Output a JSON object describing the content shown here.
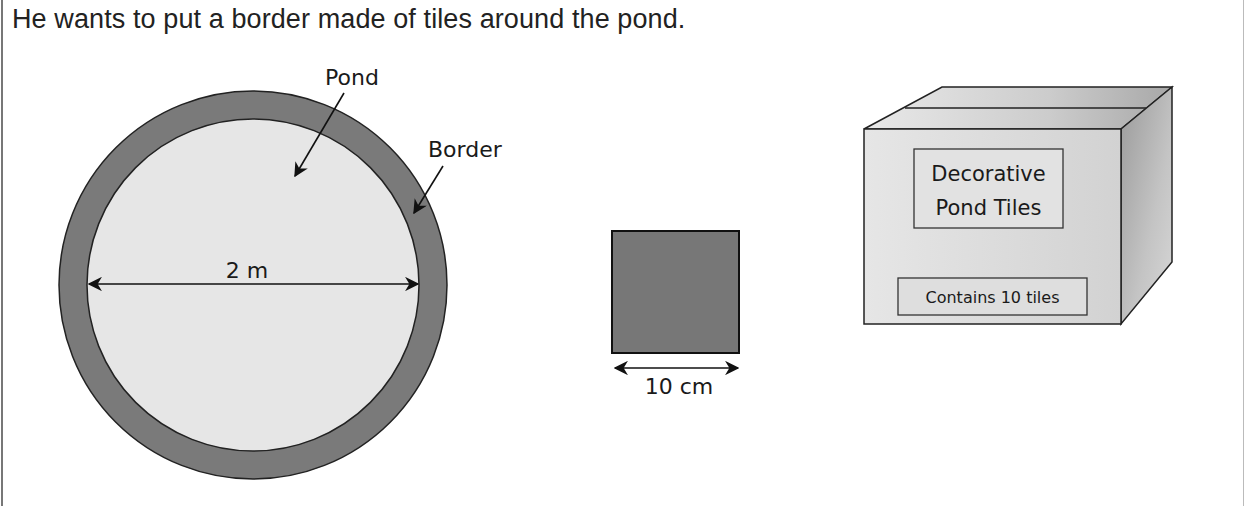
{
  "intro_text": "He wants to put a border made of tiles around the pond.",
  "pond_figure": {
    "pond_label": "Pond",
    "border_label": "Border",
    "diameter_label": "2 m",
    "colors": {
      "pond_fill": "#e6e6e6",
      "border_fill": "#7a7a7a",
      "outline": "#222222"
    }
  },
  "tile_figure": {
    "width_label": "10 cm",
    "colors": {
      "tile_fill": "#777777"
    }
  },
  "box_figure": {
    "title_line1": "Decorative",
    "title_line2": "Pond Tiles",
    "contents_label": "Contains 10 tiles"
  }
}
